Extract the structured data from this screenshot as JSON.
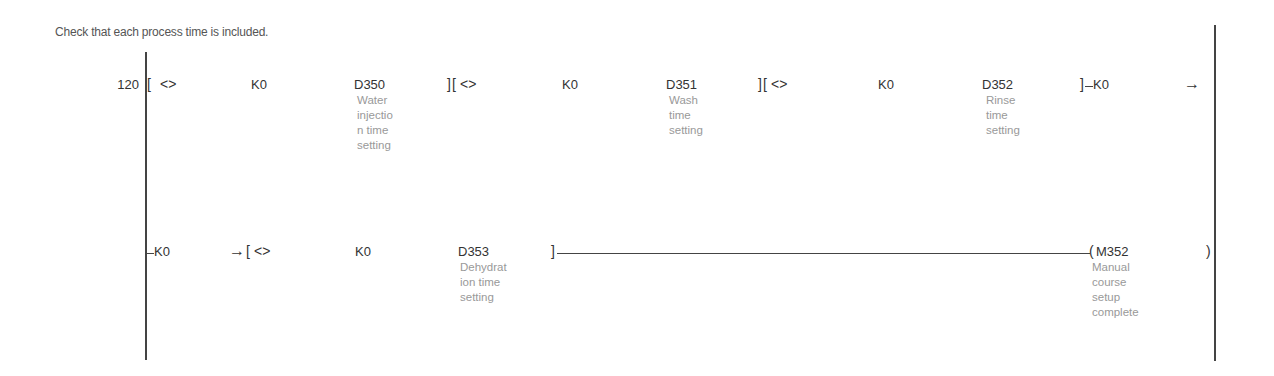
{
  "statement_comment": "Check that each process time is included.",
  "step_number": "120",
  "rung1": {
    "instructions": [
      {
        "open": "[",
        "operator": "<>",
        "operand1": "K0",
        "operand2": "D350",
        "comment": [
          "Water",
          "injectio",
          "n time",
          "setting"
        ],
        "close": "]"
      },
      {
        "open": "[",
        "operator": "<>",
        "operand1": "K0",
        "operand2": "D351",
        "comment": [
          "Wash",
          "time",
          "setting"
        ],
        "close": "]"
      },
      {
        "open": "[",
        "operator": "<>",
        "operand1": "K0",
        "operand2": "D352",
        "comment": [
          "Rinse",
          "time",
          "setting"
        ],
        "close": "]"
      }
    ],
    "tail_operand": "K0",
    "continuation_arrow": "→"
  },
  "rung2": {
    "lead_operand": "K0",
    "continuation_arrow": "→",
    "instruction": {
      "open": "[",
      "operator": "<>",
      "operand1": "K0",
      "operand2": "D353",
      "comment": [
        "Dehydrat",
        "ion time",
        "setting"
      ],
      "close": "]"
    },
    "coil": {
      "device": "M352",
      "comment": [
        "Manual",
        "course",
        "setup",
        "complete"
      ]
    }
  }
}
